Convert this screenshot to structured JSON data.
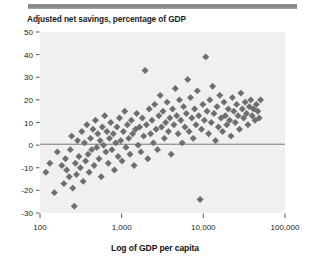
{
  "figure": {
    "title": "Adjusted net savings, percentage of GDP",
    "decor": {
      "top_rule_color": "#8a8a8a"
    }
  },
  "axis_titles": {
    "x": "Log of GDP per capita",
    "y": ""
  },
  "chart_data": {
    "type": "scatter",
    "title": "Adjusted net savings, percentage of GDP",
    "xlabel": "Log of GDP per capita",
    "ylabel": "Adjusted net savings, percentage of GDP",
    "xscale": "log",
    "xlim": [
      100,
      100000
    ],
    "ylim": [
      -30,
      50
    ],
    "xticks": [
      100,
      1000,
      10000,
      100000
    ],
    "xticklabels": [
      "100",
      "1,000",
      "10,000",
      "100,000"
    ],
    "yticks": [
      50,
      40,
      30,
      20,
      10,
      0,
      -10,
      -20,
      -30
    ],
    "yticklabels": [
      "50",
      "40",
      "30",
      "20",
      "10",
      "0",
      "-10",
      "-20",
      "-30"
    ],
    "grid": false,
    "legend": null,
    "plot_background": "#f0f0f0",
    "marker": {
      "shape": "diamond",
      "color": "#6e6e6e",
      "size": 3.2
    },
    "reference_lines": [
      {
        "orientation": "horizontal",
        "y": 0.4,
        "color": "#6b6b6b",
        "width": 0.9
      }
    ],
    "points": [
      [
        118,
        -12
      ],
      [
        132,
        -8
      ],
      [
        150,
        -21
      ],
      [
        163,
        -3
      ],
      [
        185,
        -9
      ],
      [
        196,
        -17
      ],
      [
        205,
        -6
      ],
      [
        212,
        -11
      ],
      [
        228,
        -14
      ],
      [
        235,
        -2
      ],
      [
        244,
        4
      ],
      [
        252,
        -19
      ],
      [
        263,
        -27
      ],
      [
        271,
        -8
      ],
      [
        280,
        -13
      ],
      [
        288,
        2
      ],
      [
        300,
        -5
      ],
      [
        312,
        -10
      ],
      [
        325,
        6
      ],
      [
        338,
        -16
      ],
      [
        350,
        1
      ],
      [
        362,
        -7
      ],
      [
        375,
        9
      ],
      [
        388,
        -4
      ],
      [
        400,
        -12
      ],
      [
        415,
        3
      ],
      [
        430,
        -2
      ],
      [
        445,
        7
      ],
      [
        460,
        -9
      ],
      [
        478,
        11
      ],
      [
        495,
        -1
      ],
      [
        510,
        5
      ],
      [
        528,
        -6
      ],
      [
        545,
        2
      ],
      [
        562,
        -14
      ],
      [
        580,
        8
      ],
      [
        600,
        0
      ],
      [
        620,
        13
      ],
      [
        640,
        -3
      ],
      [
        660,
        6
      ],
      [
        685,
        -8
      ],
      [
        710,
        3
      ],
      [
        735,
        10
      ],
      [
        760,
        -2
      ],
      [
        790,
        5
      ],
      [
        815,
        -11
      ],
      [
        845,
        1
      ],
      [
        875,
        8
      ],
      [
        905,
        -5
      ],
      [
        940,
        12
      ],
      [
        975,
        2
      ],
      [
        1010,
        -7
      ],
      [
        1050,
        6
      ],
      [
        1090,
        15
      ],
      [
        1130,
        -1
      ],
      [
        1175,
        9
      ],
      [
        1220,
        3
      ],
      [
        1265,
        -4
      ],
      [
        1315,
        11
      ],
      [
        1365,
        5
      ],
      [
        1420,
        -9
      ],
      [
        1475,
        7
      ],
      [
        1530,
        14
      ],
      [
        1590,
        0
      ],
      [
        1655,
        8
      ],
      [
        1720,
        -3
      ],
      [
        1790,
        12
      ],
      [
        1860,
        4
      ],
      [
        1935,
        33
      ],
      [
        2010,
        9
      ],
      [
        2090,
        -6
      ],
      [
        2175,
        16
      ],
      [
        2260,
        5
      ],
      [
        2350,
        11
      ],
      [
        2445,
        1
      ],
      [
        2540,
        18
      ],
      [
        2640,
        7
      ],
      [
        2745,
        -2
      ],
      [
        2855,
        13
      ],
      [
        2965,
        22
      ],
      [
        3080,
        8
      ],
      [
        3205,
        15
      ],
      [
        3330,
        3
      ],
      [
        3460,
        10
      ],
      [
        3600,
        19
      ],
      [
        3740,
        6
      ],
      [
        3890,
        12
      ],
      [
        4040,
        -4
      ],
      [
        4200,
        16
      ],
      [
        4370,
        9
      ],
      [
        4540,
        25
      ],
      [
        4720,
        13
      ],
      [
        4905,
        5
      ],
      [
        5100,
        20
      ],
      [
        5300,
        11
      ],
      [
        5510,
        1
      ],
      [
        5730,
        17
      ],
      [
        5955,
        8
      ],
      [
        6190,
        14
      ],
      [
        6440,
        29
      ],
      [
        6690,
        6
      ],
      [
        6960,
        21
      ],
      [
        7230,
        12
      ],
      [
        7520,
        3
      ],
      [
        7820,
        16
      ],
      [
        8130,
        9
      ],
      [
        8450,
        24
      ],
      [
        8790,
        13
      ],
      [
        9130,
        -24
      ],
      [
        9500,
        7
      ],
      [
        9870,
        18
      ],
      [
        10300,
        11
      ],
      [
        10700,
        39
      ],
      [
        11100,
        15
      ],
      [
        11600,
        5
      ],
      [
        12000,
        20
      ],
      [
        12500,
        10
      ],
      [
        13000,
        26
      ],
      [
        13500,
        14
      ],
      [
        14100,
        2
      ],
      [
        14700,
        17
      ],
      [
        15300,
        8
      ],
      [
        15900,
        22
      ],
      [
        16500,
        12
      ],
      [
        17200,
        6
      ],
      [
        17900,
        19
      ],
      [
        18600,
        13
      ],
      [
        19400,
        9
      ],
      [
        20200,
        16
      ],
      [
        21000,
        11
      ],
      [
        21800,
        4
      ],
      [
        22700,
        21
      ],
      [
        23600,
        15
      ],
      [
        24600,
        10
      ],
      [
        25600,
        18
      ],
      [
        26600,
        13
      ],
      [
        27700,
        7
      ],
      [
        28800,
        23
      ],
      [
        30000,
        16
      ],
      [
        31200,
        12
      ],
      [
        32500,
        19
      ],
      [
        33800,
        14
      ],
      [
        35200,
        9
      ],
      [
        36600,
        17
      ],
      [
        38100,
        20
      ],
      [
        39600,
        13
      ],
      [
        41200,
        16
      ],
      [
        42900,
        11
      ],
      [
        44600,
        18
      ],
      [
        46400,
        15
      ],
      [
        48300,
        12
      ],
      [
        50200,
        20
      ]
    ]
  }
}
